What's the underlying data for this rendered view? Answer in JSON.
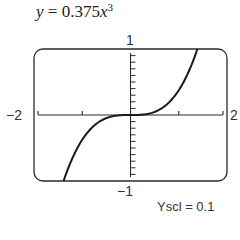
{
  "title": {
    "y": "y",
    "eq": " = 0.375",
    "x": "x",
    "exp": "3"
  },
  "labels": {
    "ymax": "1",
    "ymin": "−1",
    "xmin": "−2",
    "xmax": "2",
    "yscl": "Yscl = 0.1"
  },
  "chart_data": {
    "type": "line",
    "function": "y = 0.375*x^3",
    "xlabel": "",
    "ylabel": "",
    "xlim": [
      -2,
      2
    ],
    "ylim": [
      -1,
      1
    ],
    "xscl": 1,
    "yscl": 0.1,
    "grid": false,
    "legend": null,
    "annotations": [
      "Yscl = 0.1"
    ],
    "x": [
      -1.387,
      -1.25,
      -1.0,
      -0.75,
      -0.5,
      -0.25,
      0,
      0.25,
      0.5,
      0.75,
      1.0,
      1.25,
      1.387
    ],
    "values": [
      -1.0,
      -0.732,
      -0.375,
      -0.158,
      -0.047,
      -0.006,
      0,
      0.006,
      0.047,
      0.158,
      0.375,
      0.732,
      1.0
    ]
  }
}
